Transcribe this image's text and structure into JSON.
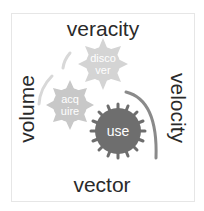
{
  "diagram": {
    "labels": {
      "top": "veracity",
      "left": "volume",
      "right": "velocity",
      "bottom": "vector"
    },
    "gears": [
      {
        "id": "discover",
        "lines": [
          "disco",
          "ver"
        ],
        "color": "#d4d4d4"
      },
      {
        "id": "acquire",
        "lines": [
          "acq",
          "uire"
        ],
        "color": "#c8c8c8"
      },
      {
        "id": "use",
        "lines": [
          "use"
        ],
        "color": "#6e6e6e"
      }
    ],
    "colors": {
      "text": "#2a2a2a",
      "arc_light": "#d8d8d8",
      "arc_dark": "#8a8a8a",
      "frame": "#e6e6e6"
    }
  }
}
